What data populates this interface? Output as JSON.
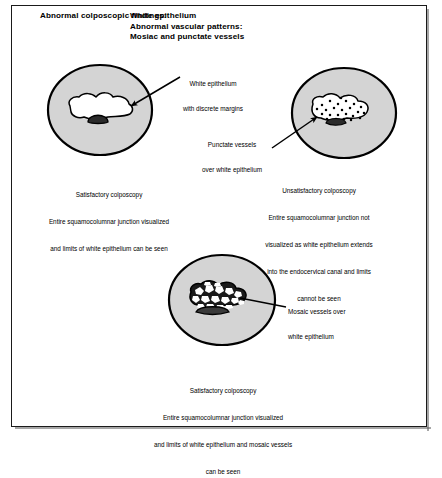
{
  "figure": {
    "header": {
      "lead": "Abnormal colposcopic findings:",
      "lines": [
        "White epithelium",
        "Abnormal vascular patterns:",
        "Mosiac and punctate vessels"
      ]
    },
    "annotations": [
      {
        "name": "white-epithelium",
        "lines": [
          "White epithelium",
          "with discrete margins"
        ]
      },
      {
        "name": "punctate-vessels",
        "lines": [
          "Punctate vessels",
          "over white epithelium"
        ]
      },
      {
        "name": "mosaic-vessels",
        "lines": [
          "Mosaic vessels over",
          "white epithelium"
        ]
      }
    ],
    "panels": [
      {
        "name": "panel-left-white-epithelium",
        "caption": [
          "Satisfactory colposcopy",
          "Entire squamocolumnar junction visualized",
          "and limits of white epithelium can be seen"
        ]
      },
      {
        "name": "panel-right-punctate",
        "caption": [
          "Unsatisfactory colposcopy",
          "Entire squamocolumnar junction not",
          "visualized as white epithelium extends",
          "into the endocervical canal and limits",
          "cannot be seen"
        ]
      },
      {
        "name": "panel-bottom-mosaic",
        "caption": [
          "Satisfactory colposcopy",
          "Entire squamocolumnar junction visualized",
          "and limits of white epithelium and mosaic vessels",
          "can be seen"
        ]
      }
    ],
    "colors": {
      "cervix_fill": "#d4d4d4",
      "outline": "#000000",
      "lesion_white": "#ffffff",
      "os_black": "#1a1a1a",
      "frame": "#1a1a1a",
      "page": "#ffffff"
    }
  }
}
